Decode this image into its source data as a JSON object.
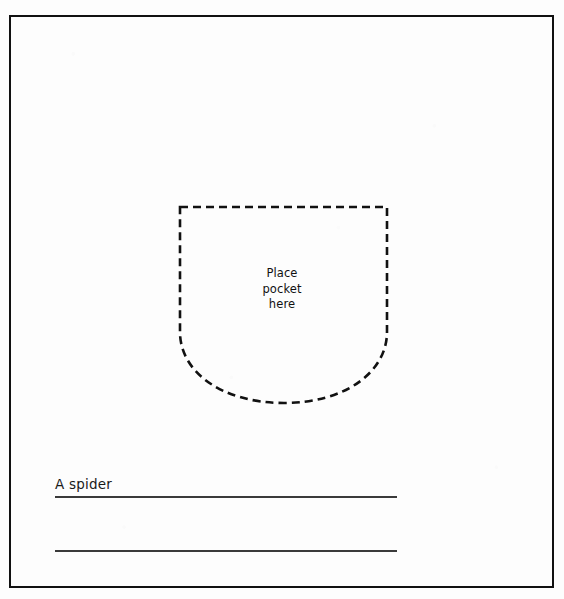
{
  "page": {
    "background_color": "#fdfdfd",
    "frame_color": "#111111",
    "ink_color": "#111111",
    "rule_color": "#3a3a3a",
    "width": 564,
    "height": 599
  },
  "pocket_outline": {
    "name": "pocket-placement-outline",
    "style": "dashed",
    "dash_length": 8,
    "dash_gap": 5,
    "stroke_width": 2.6,
    "stroke_color": "#111111",
    "top_y": 207,
    "left_x": 180,
    "right_x": 387,
    "bottom_y": 403,
    "straight_side_bottom_y": 332,
    "description": "U-shaped pocket template with flat top edge, vertical sides and a rounded bottom curve"
  },
  "instruction": {
    "lines": [
      "Place",
      "pocket",
      "here"
    ],
    "line1": "Place",
    "line2": "pocket",
    "line3": "here"
  },
  "caption": {
    "text": "A spider"
  },
  "rules": [
    {
      "label": "first-writing-line",
      "y": 496
    },
    {
      "label": "second-writing-line",
      "y": 550
    }
  ]
}
